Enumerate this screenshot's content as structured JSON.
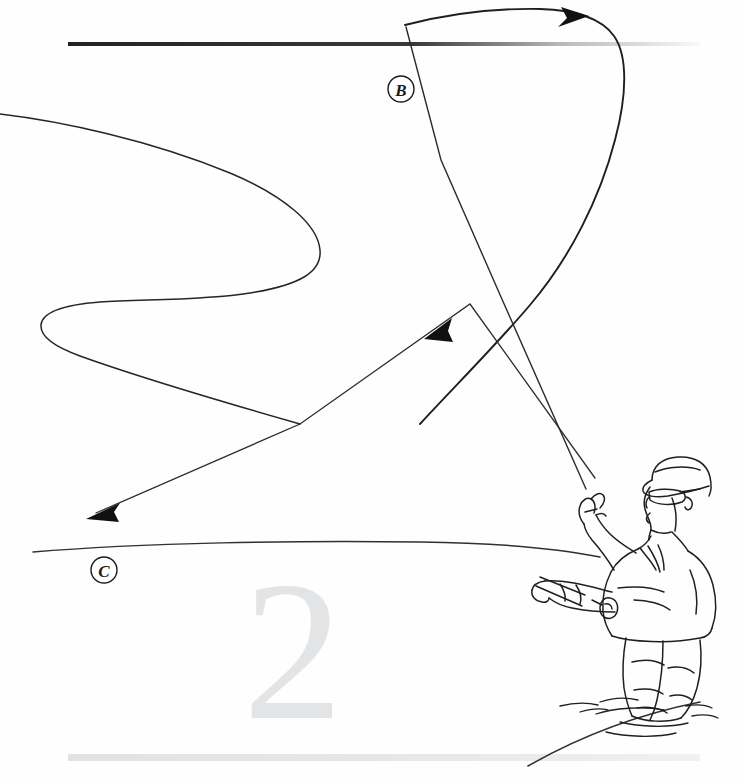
{
  "page": {
    "width": 738,
    "height": 784,
    "background_color": "#fefefe",
    "kind": "instructional-line-art-illustration",
    "step_number_watermark": "2",
    "watermark_color": "#e3e4e6",
    "ink_color": "#1a1a1a"
  },
  "rules": {
    "top_rule": {
      "name": "top-horizontal-rule",
      "x1": 68,
      "x2": 700,
      "y": 44,
      "thickness": 4,
      "color_start": "#2b2b2b",
      "color_end": "#f4f4f4"
    },
    "bottom_rule": {
      "name": "bottom-horizontal-rule",
      "x1": 68,
      "x2": 700,
      "y": 757,
      "thickness": 7,
      "color_start": "#e6e6e6",
      "color_end": "#eeeeee"
    }
  },
  "labels": [
    {
      "id": "label-b",
      "text": "B",
      "cx": 401,
      "cy": 89,
      "radius": 13,
      "description": "circled script letter B marking the back-cast loop path"
    },
    {
      "id": "label-c",
      "text": "C",
      "cx": 104,
      "cy": 570,
      "radius": 13,
      "description": "circled script letter C marking the forward line / water surface"
    }
  ],
  "arrows": [
    {
      "id": "arrow-top-right",
      "name": "arrow-loop-travel-direction",
      "tip_x": 586,
      "tip_y": 16,
      "direction": "right",
      "description": "arrowhead on the upper arc showing line unrolling to the right"
    },
    {
      "id": "arrow-mid",
      "name": "arrow-line-descent-direction",
      "tip_x": 427,
      "tip_y": 337,
      "direction": "down-left",
      "description": "arrowhead mid-frame showing the line travelling down and to the left"
    },
    {
      "id": "arrow-lower-left",
      "name": "arrow-forward-cast-direction",
      "tip_x": 88,
      "tip_y": 517,
      "direction": "down-left",
      "description": "arrowhead at lower left showing direction of the forward cast"
    }
  ],
  "strokes": {
    "fly_line_s_curve": {
      "name": "fly-line-s-curve",
      "description": "large S-shaped slack loop of fly line across the upper left"
    },
    "upper_arc": {
      "name": "fly-line-upper-arc",
      "description": "arc sweeping from the rod line up over the top and curling down right"
    },
    "rod_line": {
      "name": "rod-and-leader-line",
      "description": "straight line from the raised hand up to the top-left of the frame"
    },
    "descending_line": {
      "name": "descending-line",
      "description": "long straight line from the top-right arc down to the lower-left arrowhead"
    },
    "water_surface_line": {
      "name": "water-surface-line",
      "description": "near-horizontal water line crossing the lower half"
    },
    "shoreline": {
      "name": "shoreline-curve",
      "description": "gentle curve in the lower-right corner suggesting the far bank"
    }
  },
  "figure": {
    "name": "fisherman-figure",
    "parts": [
      {
        "name": "cap",
        "label": "ball cap"
      },
      {
        "name": "sunglasses",
        "label": "sunglasses"
      },
      {
        "name": "head",
        "label": "head in profile"
      },
      {
        "name": "jacket",
        "label": "jacket"
      },
      {
        "name": "upper-arm-raised",
        "label": "raised line hand"
      },
      {
        "name": "lower-arm-rod",
        "label": "rod hand"
      },
      {
        "name": "fly-reel",
        "label": "fly reel"
      },
      {
        "name": "rod-grip",
        "label": "rod grip"
      },
      {
        "name": "waders",
        "label": "chest waders"
      },
      {
        "name": "water-ripples",
        "label": "water ripples at legs"
      }
    ]
  }
}
